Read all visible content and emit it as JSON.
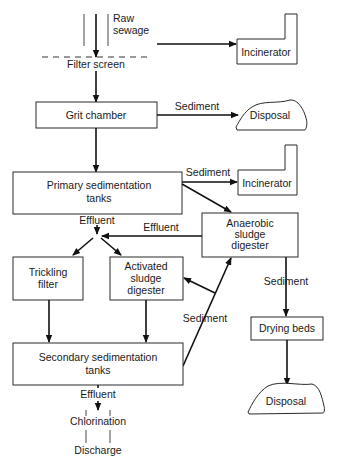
{
  "diagram": {
    "nodes": {
      "raw_sewage": "Raw\nsewage",
      "filter_screen": "Filter screen",
      "incinerator_1": "Incinerator",
      "grit_chamber": "Grit chamber",
      "disposal_1": "Disposal",
      "primary_sedimentation": "Primary sedimentation\ntanks",
      "incinerator_2": "Incinerator",
      "anaerobic_digester": "Anaerobic\nsludge\ndigester",
      "trickling_filter": "Trickling\nfilter",
      "activated_sludge": "Activated\nsludge\ndigester",
      "secondary_sedimentation": "Secondary sedimentation\ntanks",
      "drying_beds": "Drying beds",
      "disposal_2": "Disposal",
      "chlorination": "Chlorination",
      "discharge": "Discharge"
    },
    "edge_labels": {
      "grit_sediment": "Sediment",
      "primary_sediment": "Sediment",
      "primary_effluent": "Effluent",
      "anaerobic_effluent": "Effluent",
      "secondary_sediment": "Sediment",
      "anaerobic_sediment": "Sediment",
      "secondary_effluent": "Effluent"
    },
    "edges": [
      {
        "from": "raw_sewage",
        "to": "filter_screen"
      },
      {
        "from": "filter_screen",
        "to": "incinerator_1"
      },
      {
        "from": "filter_screen",
        "to": "grit_chamber"
      },
      {
        "from": "grit_chamber",
        "to": "disposal_1",
        "label": "Sediment"
      },
      {
        "from": "grit_chamber",
        "to": "primary_sedimentation"
      },
      {
        "from": "primary_sedimentation",
        "to": "incinerator_2",
        "label": "Sediment"
      },
      {
        "from": "primary_sedimentation",
        "to": "anaerobic_digester"
      },
      {
        "from": "primary_sedimentation",
        "to": "effluent_junction",
        "label": "Effluent"
      },
      {
        "from": "anaerobic_digester",
        "to": "effluent_junction",
        "label": "Effluent"
      },
      {
        "from": "effluent_junction",
        "to": "trickling_filter"
      },
      {
        "from": "effluent_junction",
        "to": "activated_sludge"
      },
      {
        "from": "trickling_filter",
        "to": "secondary_sedimentation"
      },
      {
        "from": "activated_sludge",
        "to": "secondary_sedimentation"
      },
      {
        "from": "secondary_sedimentation",
        "to": "anaerobic_digester",
        "label": "Sediment"
      },
      {
        "from": "secondary_sedimentation",
        "to": "activated_sludge",
        "label": "Sediment"
      },
      {
        "from": "anaerobic_digester",
        "to": "drying_beds",
        "label": "Sediment"
      },
      {
        "from": "drying_beds",
        "to": "disposal_2"
      },
      {
        "from": "secondary_sedimentation",
        "to": "chlorination",
        "label": "Effluent"
      },
      {
        "from": "chlorination",
        "to": "discharge"
      }
    ]
  }
}
